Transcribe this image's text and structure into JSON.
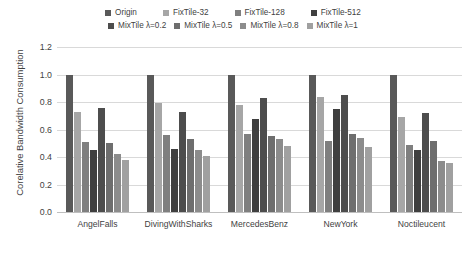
{
  "chart_data": {
    "type": "bar",
    "title": "",
    "xlabel": "",
    "ylabel": "Corelative Bandwidth Consumption",
    "ylim": [
      0,
      1.2
    ],
    "ytick_labels": [
      "1.2",
      "1.0",
      "0.8",
      "0.6",
      "0.4",
      "0.2",
      "0.0"
    ],
    "ytick_values": [
      1.2,
      1.0,
      0.8,
      0.6,
      0.4,
      0.2,
      0.0
    ],
    "grid": true,
    "legend_position": "top",
    "categories": [
      "AngelFalls",
      "DivingWithSharks",
      "MercedesBenz",
      "NewYork",
      "Noctileucent"
    ],
    "series": [
      {
        "name": "Origin",
        "color": "#595959",
        "values": [
          1.0,
          1.0,
          1.0,
          1.0,
          1.0
        ]
      },
      {
        "name": "FixTile-32",
        "color": "#a6a6a6",
        "values": [
          0.73,
          0.79,
          0.78,
          0.84,
          0.69
        ]
      },
      {
        "name": "FixTile-128",
        "color": "#7f7f7f",
        "values": [
          0.51,
          0.56,
          0.57,
          0.52,
          0.49
        ]
      },
      {
        "name": "FixTile-512",
        "color": "#3f3f3f",
        "values": [
          0.45,
          0.46,
          0.68,
          0.75,
          0.45
        ]
      },
      {
        "name": "MixTile λ=0.2",
        "color": "#4d4d4d",
        "values": [
          0.76,
          0.73,
          0.83,
          0.85,
          0.72
        ]
      },
      {
        "name": "MixTile λ=0.5",
        "color": "#6e6e6e",
        "values": [
          0.5,
          0.53,
          0.55,
          0.57,
          0.52
        ]
      },
      {
        "name": "MixTile λ=0.8",
        "color": "#8c8c8c",
        "values": [
          0.42,
          0.45,
          0.53,
          0.54,
          0.37
        ]
      },
      {
        "name": "MixTile λ=1",
        "color": "#a0a0a0",
        "values": [
          0.38,
          0.41,
          0.48,
          0.47,
          0.36
        ]
      }
    ]
  }
}
